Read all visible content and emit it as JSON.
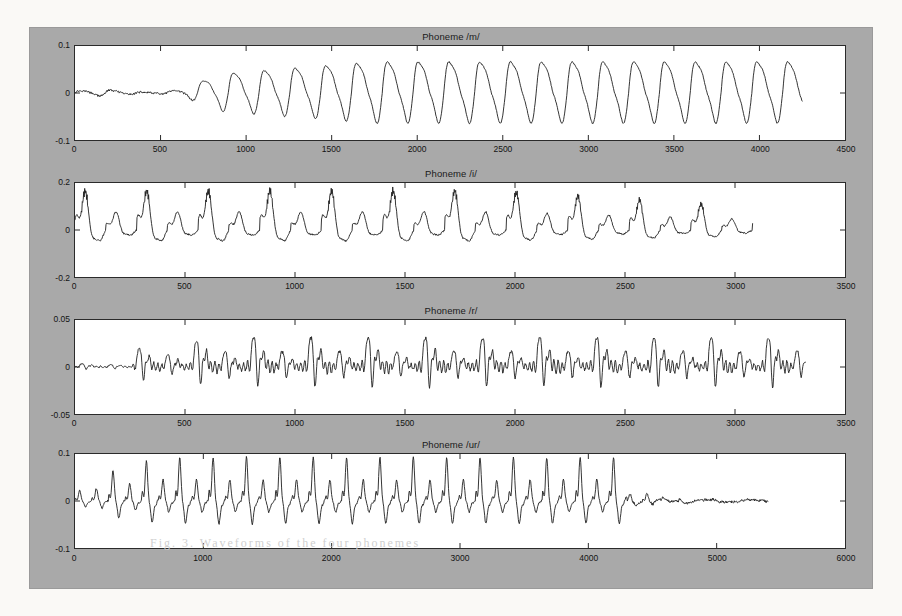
{
  "figure": {
    "background_color": "#a9a9a9",
    "axes_background_color": "#ffffff",
    "trace_color": "#1f1f1f"
  },
  "chart_data": [
    {
      "type": "line",
      "title": "Phoneme /m/",
      "xlabel": "",
      "ylabel": "",
      "xlim": [
        0,
        4500
      ],
      "ylim": [
        -0.1,
        0.1
      ],
      "xticks": [
        0,
        500,
        1000,
        1500,
        2000,
        2500,
        3000,
        3500,
        4000,
        4500
      ],
      "xticklabels": [
        "0",
        "500",
        "1000",
        "1500",
        "2000",
        "2500",
        "3000",
        "3500",
        "4000",
        "4500"
      ],
      "yticks": [
        -0.1,
        0,
        0.1
      ],
      "yticklabels": [
        "-0.1",
        "0",
        "0.1"
      ],
      "grid": false,
      "legend": null,
      "signal_extent": [
        0,
        4250
      ],
      "description": "Voiced nasal /m/: near-silent onset rising to steady periodic oscillation; period about 180 samples, peak amplitude about 0.075, trough about -0.055.",
      "period": 180,
      "onset_end": 850,
      "peak_amplitude": 0.075,
      "trough_amplitude": -0.055
    },
    {
      "type": "line",
      "title": "Phoneme /i/",
      "xlabel": "",
      "ylabel": "",
      "xlim": [
        0,
        3500
      ],
      "ylim": [
        -0.2,
        0.2
      ],
      "xticks": [
        0,
        500,
        1000,
        1500,
        2000,
        2500,
        3000,
        3500
      ],
      "xticklabels": [
        "0",
        "500",
        "1000",
        "1500",
        "2000",
        "2500",
        "3000",
        "3500"
      ],
      "yticks": [
        -0.2,
        0,
        0.2
      ],
      "yticklabels": [
        "-0.2",
        "0",
        "0.2"
      ],
      "grid": false,
      "legend": null,
      "signal_extent": [
        0,
        3080
      ],
      "description": "Vowel /i/: alternating tall and short glottal pulses, period about 140 samples, tall peaks near 0.165 decaying to 0.09 at the end, troughs near -0.085.",
      "period": 140,
      "peak_amplitude": 0.165,
      "trough_amplitude": -0.085
    },
    {
      "type": "line",
      "title": "Phoneme /r/",
      "xlabel": "",
      "ylabel": "",
      "xlim": [
        0,
        3500
      ],
      "ylim": [
        -0.05,
        0.05
      ],
      "xticks": [
        0,
        500,
        1000,
        1500,
        2000,
        2500,
        3000,
        3500
      ],
      "xticklabels": [
        "0",
        "500",
        "1000",
        "1500",
        "2000",
        "2500",
        "3000",
        "3500"
      ],
      "yticks": [
        -0.05,
        0,
        0.05
      ],
      "yticklabels": [
        "-0.05",
        "0",
        "0.05"
      ],
      "grid": false,
      "legend": null,
      "signal_extent": [
        0,
        3320
      ],
      "description": "Approximant /r/: sharp narrow glottal spikes with secondary bumps, period about 130 samples, spike peaks near 0.04, troughs near -0.022.",
      "period": 130,
      "peak_amplitude": 0.04,
      "trough_amplitude": -0.022
    },
    {
      "type": "line",
      "title": "Phoneme /ur/",
      "xlabel": "",
      "ylabel": "",
      "xlim": [
        0,
        6000
      ],
      "ylim": [
        -0.1,
        0.1
      ],
      "xticks": [
        0,
        1000,
        2000,
        3000,
        4000,
        5000,
        6000
      ],
      "xticklabels": [
        "0",
        "1000",
        "2000",
        "3000",
        "4000",
        "5000",
        "6000"
      ],
      "yticks": [
        -0.1,
        0,
        0.1
      ],
      "yticklabels": [
        "-0.1",
        "0",
        "0.1"
      ],
      "grid": false,
      "legend": null,
      "signal_extent": [
        0,
        5400
      ],
      "description": "Vowel /ur/: dense periodic pulses of alternating tall and short peaks up to about 0.085, decaying after roughly sample 4300 to a near-flat low-amplitude tail that ends near sample 5400.",
      "period": 130,
      "decay_start": 4300,
      "peak_amplitude": 0.085,
      "trough_amplitude": -0.06
    }
  ],
  "watermark": {
    "text": "Fig. 3.   Waveforms of the four phonemes"
  }
}
